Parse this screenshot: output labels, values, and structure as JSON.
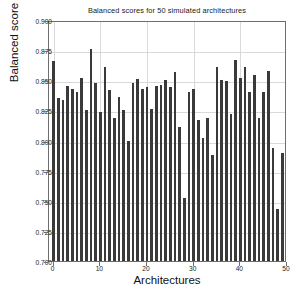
{
  "chart_data": {
    "type": "bar",
    "title": "Balanced scores for 50 simulated architectures",
    "xlabel": "Architectures",
    "ylabel": "Balanced score",
    "ylim": [
      0.7,
      0.9
    ],
    "xlim": [
      -1,
      50
    ],
    "grid": true,
    "legend": null,
    "bar_color": "#3a3a3a",
    "background_color": "#ffffff",
    "grid_color": "#d9d9d9",
    "ytick_labels": [
      "0.700",
      "0.725",
      "0.750",
      "0.775",
      "0.800",
      "0.825",
      "0.850",
      "0.875",
      "0.900"
    ],
    "ytick_values": [
      0.7,
      0.725,
      0.75,
      0.775,
      0.8,
      0.825,
      0.85,
      0.875,
      0.9
    ],
    "xtick_labels": [
      "0",
      "10",
      "20",
      "30",
      "40",
      "50"
    ],
    "xtick_values": [
      0,
      10,
      20,
      30,
      40,
      50
    ],
    "categories": [
      0,
      1,
      2,
      3,
      4,
      5,
      6,
      7,
      8,
      9,
      10,
      11,
      12,
      13,
      14,
      15,
      16,
      17,
      18,
      19,
      20,
      21,
      22,
      23,
      24,
      25,
      26,
      27,
      28,
      29,
      30,
      31,
      32,
      33,
      34,
      35,
      36,
      37,
      38,
      39,
      40,
      41,
      42,
      43,
      44,
      45,
      46,
      47,
      48,
      49
    ],
    "values": [
      0.866,
      0.835,
      0.834,
      0.845,
      0.843,
      0.84,
      0.852,
      0.825,
      0.876,
      0.848,
      0.824,
      0.861,
      0.842,
      0.819,
      0.836,
      0.825,
      0.8,
      0.848,
      0.851,
      0.843,
      0.844,
      0.826,
      0.845,
      0.846,
      0.85,
      0.844,
      0.857,
      0.811,
      0.752,
      0.84,
      0.843,
      0.817,
      0.802,
      0.819,
      0.788,
      0.861,
      0.85,
      0.849,
      0.822,
      0.867,
      0.852,
      0.861,
      0.84,
      0.854,
      0.819,
      0.84,
      0.858,
      0.794,
      0.743,
      0.79
    ]
  }
}
